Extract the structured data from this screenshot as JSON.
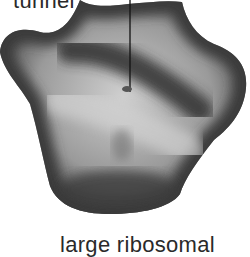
{
  "diagram": {
    "labels": {
      "tunnel": "tunnel",
      "subunit": "large ribosomal"
    },
    "colors": {
      "background": "#ffffff",
      "shape_dark": "#3a3a3a",
      "shape_light": "#d8d8d8",
      "pointer_line": "#111111",
      "text": "#2a2a2a"
    }
  }
}
